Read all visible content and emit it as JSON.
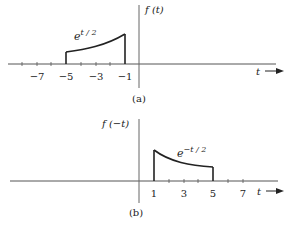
{
  "figure": {
    "panel_a": {
      "ylabel": "f (t)",
      "curve_label_base": "e",
      "curve_label_exp": "t / 2",
      "xlabel": "t",
      "caption": "(a)",
      "ticks": [
        "−7",
        "−5",
        "−3",
        "−1"
      ],
      "tick_values": [
        -7,
        -5,
        -3,
        -1
      ],
      "curve": {
        "expr": "e^(t/2)",
        "t_start": -5,
        "t_end": -1
      }
    },
    "panel_b": {
      "ylabel": "f (−t)",
      "curve_label_base": "e",
      "curve_label_exp": "−t / 2",
      "xlabel": "t",
      "caption": "(b)",
      "ticks": [
        "1",
        "3",
        "5",
        "7"
      ],
      "tick_values": [
        1,
        3,
        5,
        7
      ],
      "curve": {
        "expr": "e^(−t/2)",
        "t_start": 1,
        "t_end": 5
      }
    },
    "colors": {
      "ink": "#222222",
      "axis": "#555555",
      "background": "#ffffff"
    }
  }
}
